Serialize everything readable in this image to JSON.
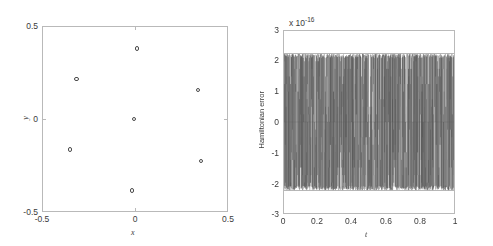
{
  "figure": {
    "background": "#ffffff",
    "axis_color": "#b9b9b9",
    "text_color": "#3a3a3a",
    "marker_color": "#4a4a4a",
    "trace_color": "#555555"
  },
  "panels": {
    "left": {
      "name": "phase-space-scatter",
      "xlabel": "x",
      "ylabel": "y",
      "xticks": [
        "-0.5",
        "0",
        "0.5"
      ],
      "yticks": [
        "-0.5",
        "0",
        "0.5"
      ],
      "xlim": [
        -0.5,
        0.5
      ],
      "ylim": [
        -0.5,
        0.5
      ]
    },
    "right": {
      "name": "hamiltonian-error-plot",
      "xlabel": "t",
      "ylabel": "Hamiltonian error",
      "exponent_prefix": "x 10",
      "exponent_value": "-16",
      "xticks": [
        "0",
        "0.2",
        "0.4",
        "0.6",
        "0.8",
        "1"
      ],
      "yticks": [
        "-3",
        "-2",
        "-1",
        "0",
        "1",
        "2",
        "3"
      ],
      "xlim": [
        0,
        1
      ],
      "ylim": [
        -3,
        3
      ]
    }
  },
  "chart_data": [
    {
      "type": "scatter",
      "name": "particle-positions",
      "title": "",
      "xlabel": "x",
      "ylabel": "y",
      "xlim": [
        -0.5,
        0.5
      ],
      "ylim": [
        -0.5,
        0.5
      ],
      "xticks": [
        -0.5,
        0,
        0.5
      ],
      "yticks": [
        -0.5,
        0,
        0.5
      ],
      "grid": false,
      "legend": null,
      "marker": "open-circle",
      "points": [
        {
          "x": 0.01,
          "y": 0.38
        },
        {
          "x": -0.315,
          "y": 0.215
        },
        {
          "x": 0.34,
          "y": 0.155
        },
        {
          "x": -0.005,
          "y": 0.0
        },
        {
          "x": -0.35,
          "y": -0.165
        },
        {
          "x": 0.355,
          "y": -0.225
        },
        {
          "x": -0.015,
          "y": -0.385
        }
      ]
    },
    {
      "type": "line",
      "name": "hamiltonian-error-vs-time",
      "title": "",
      "xlabel": "t",
      "ylabel": "Hamiltonian error",
      "y_exponent": -16,
      "xlim": [
        0,
        1
      ],
      "ylim": [
        -3,
        3
      ],
      "xticks": [
        0,
        0.2,
        0.4,
        0.6,
        0.8,
        1
      ],
      "yticks": [
        -3,
        -2,
        -1,
        0,
        1,
        2,
        3
      ],
      "grid": false,
      "legend": null,
      "description": "Dense high-frequency oscillation of the Hamiltonian error filling the band between about -2.25e-16 and +2.25e-16 across the whole time interval.",
      "envelope_upper": 2.25,
      "envelope_lower": -2.25,
      "n_samples": 2000,
      "seed": 7
    }
  ]
}
